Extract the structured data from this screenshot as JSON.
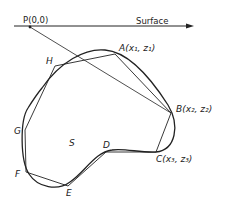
{
  "diagram": {
    "labels": {
      "origin": "P(0,0)",
      "surface": "Surface",
      "A": "A(x₁, z₁)",
      "B": "B(x₂, z₂)",
      "C": "C(x₃, z₃)",
      "D": "D",
      "E": "E",
      "F": "F",
      "G": "G",
      "H": "H",
      "S": "S"
    },
    "vertices": {
      "P": [
        30,
        27
      ],
      "A": [
        115,
        54
      ],
      "B": [
        171,
        113
      ],
      "C": [
        156,
        152
      ],
      "D": [
        106,
        152
      ],
      "E": [
        68,
        186
      ],
      "F": [
        26,
        172
      ],
      "G": [
        25,
        130
      ],
      "H": [
        55,
        66
      ]
    },
    "colors": {
      "stroke": "#222222",
      "background": "#ffffff"
    }
  }
}
